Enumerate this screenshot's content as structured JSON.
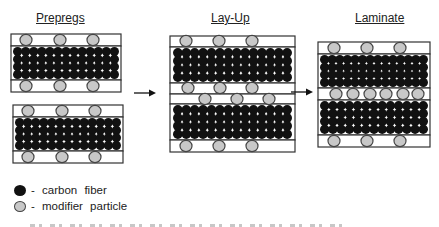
{
  "stages": [
    {
      "id": "prepregs",
      "title": "Prepregs"
    },
    {
      "id": "layup",
      "title": "Lay-Up"
    },
    {
      "id": "laminate",
      "title": "Laminate"
    }
  ],
  "legend": {
    "items": [
      {
        "symbol": "carbon-fiber",
        "label": "- carbon fiber"
      },
      {
        "symbol": "modifier-particle",
        "label": "- modifier particle"
      }
    ]
  },
  "colors": {
    "fiber": "#111111",
    "particle_fill": "#c8c8c8",
    "particle_stroke": "#444444",
    "box_stroke": "#333333",
    "arrow": "#111111"
  },
  "diagram": {
    "fiber_rows_per_ply": 4,
    "particles_per_interface_prepreg": 3,
    "particles_in_laminate_interlayer": 6,
    "arrows": 2
  }
}
